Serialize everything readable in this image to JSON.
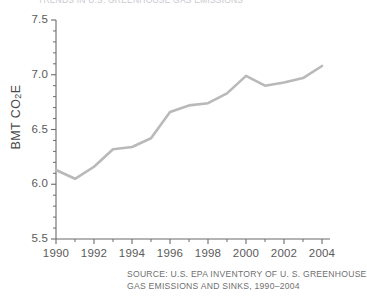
{
  "figure": {
    "title_cropped": "TRENDS IN U.S. GREENHOUSE GAS EMISSIONS",
    "source_line_1": "SOURCE: U.S. EPA INVENTORY OF U. S. GREENHOUSE",
    "source_line_2": "GAS EMISSIONS AND SINKS, 1990–2004",
    "line_color": "#b9b9b9",
    "axis_color": "#6b6b6b",
    "text_color": "#5a5a5a"
  },
  "chart_data": {
    "type": "line",
    "title": "TRENDS IN U.S. GREENHOUSE GAS EMISSIONS",
    "xlabel": "",
    "ylabel": "BMT CO2E",
    "ylabel_display": "BMT CO₂E",
    "x": [
      1990,
      1991,
      1992,
      1993,
      1994,
      1995,
      1996,
      1997,
      1998,
      1999,
      2000,
      2001,
      2002,
      2003,
      2004
    ],
    "values": [
      6.13,
      6.05,
      6.16,
      6.32,
      6.34,
      6.42,
      6.66,
      6.72,
      6.74,
      6.83,
      6.99,
      6.9,
      6.93,
      6.97,
      7.08
    ],
    "series": [
      {
        "name": "U.S. greenhouse gas emissions",
        "values": [
          6.13,
          6.05,
          6.16,
          6.32,
          6.34,
          6.42,
          6.66,
          6.72,
          6.74,
          6.83,
          6.99,
          6.9,
          6.93,
          6.97,
          7.08
        ]
      }
    ],
    "xlim": [
      1990,
      2004
    ],
    "ylim": [
      5.5,
      7.5
    ],
    "ytick_labels": [
      "7.5",
      "7.0",
      "6.5",
      "6.0",
      "5.5"
    ],
    "ytick_values": [
      7.5,
      7.0,
      6.5,
      6.0,
      5.5
    ],
    "yminor_step": 0.1,
    "xtick_labels": [
      "1990",
      "1992",
      "1994",
      "1996",
      "1998",
      "2000",
      "2002",
      "2004"
    ],
    "xtick_values": [
      1990,
      1992,
      1994,
      1996,
      1998,
      2000,
      2002,
      2004
    ],
    "xminor_step": 1,
    "grid": false,
    "legend": false,
    "units": "BMT CO2E"
  }
}
